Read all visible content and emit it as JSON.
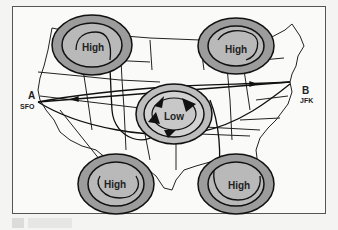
{
  "figure": {
    "title": "",
    "colors": {
      "system_fill_outer": "#9c9c9c",
      "system_fill_inner": "#b9b9b9",
      "line": "#1a1a1a",
      "background": "#fafaf8"
    }
  },
  "points": [
    {
      "id": "A",
      "label": "A",
      "code": "SFO"
    },
    {
      "id": "B",
      "label": "B",
      "code": "JFK"
    }
  ],
  "pressure_systems": [
    {
      "name": "high-northwest",
      "label": "High"
    },
    {
      "name": "high-northeast",
      "label": "High"
    },
    {
      "name": "low-center",
      "label": "Low"
    },
    {
      "name": "high-southwest",
      "label": "High"
    },
    {
      "name": "high-southeast",
      "label": "High"
    }
  ],
  "caption": ""
}
